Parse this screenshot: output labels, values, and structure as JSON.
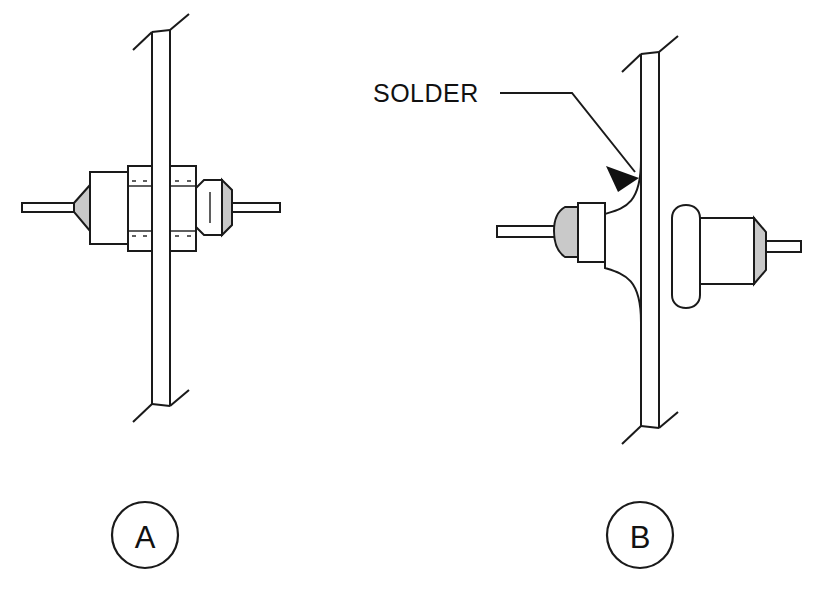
{
  "figure": {
    "background_color": "#ffffff",
    "line_color": "#1a1a1a",
    "shade_color": "#c9c9c9",
    "width": 823,
    "height": 604
  },
  "annotations": {
    "solder_label": "SOLDER",
    "solder_label_x": 373,
    "solder_label_y": 102
  },
  "callouts": [
    {
      "id": "callout-a",
      "letter": "A",
      "cx": 145,
      "cy": 535,
      "r": 33,
      "description": "Nut-mounted feedthrough terminal"
    },
    {
      "id": "callout-b",
      "letter": "B",
      "cx": 640,
      "cy": 535,
      "r": 33,
      "description": "Solder-mounted feedthrough terminal"
    }
  ],
  "views": [
    {
      "id": "view-a",
      "letter": "A",
      "panel": {
        "name": "chassis-panel",
        "top_y": 30,
        "bottom_y": 410,
        "thickness_px": 14,
        "break_lines": true
      },
      "parts": [
        {
          "name": "left-lead-wire",
          "type": "wire"
        },
        {
          "name": "insulator-body",
          "type": "body"
        },
        {
          "name": "shoulder-taper",
          "type": "shaded-taper"
        },
        {
          "name": "front-hex-nut",
          "type": "hex-nut"
        },
        {
          "name": "rear-hex-nut",
          "type": "hex-nut"
        },
        {
          "name": "rear-insulator-bead",
          "type": "shaded-bead"
        },
        {
          "name": "right-lead-wire",
          "type": "wire"
        }
      ]
    },
    {
      "id": "view-b",
      "letter": "B",
      "panel": {
        "name": "chassis-panel",
        "top_y": 52,
        "bottom_y": 432,
        "thickness_px": 14,
        "break_lines": true
      },
      "parts": [
        {
          "name": "left-lead-wire",
          "type": "wire"
        },
        {
          "name": "left-insulator-bead",
          "type": "shaded-bead"
        },
        {
          "name": "solder-fillet",
          "type": "fillet"
        },
        {
          "name": "rear-bushing",
          "type": "sleeve"
        },
        {
          "name": "rear-insulator-body",
          "type": "body"
        },
        {
          "name": "rear-shoulder-taper",
          "type": "shaded-taper"
        },
        {
          "name": "right-lead-wire",
          "type": "wire"
        }
      ]
    }
  ]
}
